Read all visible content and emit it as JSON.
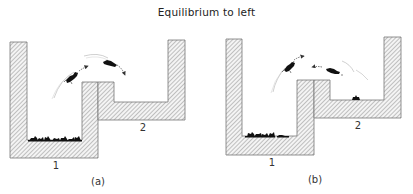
{
  "title": "Equilibrium to left",
  "panels": [
    {
      "id": "a",
      "caption": "(a)",
      "container_labels": {
        "c1": "1",
        "c2": "2"
      },
      "description": "Many mice in lower container 1; mice jumping from 1 over the wall into container 2; container 2 empty"
    },
    {
      "id": "b",
      "caption": "(b)",
      "container_labels": {
        "c1": "1",
        "c2": "2"
      },
      "description": "Mice jumping in both directions between containers; most mice in container 1, one mouse in container 2"
    }
  ],
  "colors": {
    "hatch_line": "#8a8a8a",
    "wall_border": "#777777",
    "mouse": "#111111",
    "arrow": "#333333",
    "motion_trail": "#aaaaaa"
  },
  "icons": {
    "mouse": "mouse-silhouette-icon",
    "arrow": "curved-arrow-icon"
  }
}
